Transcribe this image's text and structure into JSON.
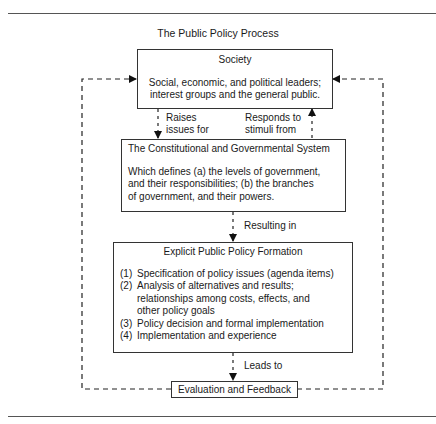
{
  "title": "The Public Policy Process",
  "society": {
    "heading": "Society",
    "body_lines": [
      "Social, economic, and political leaders;",
      "interest groups and the general public."
    ]
  },
  "arrows": {
    "raises": [
      "Raises",
      "issues for"
    ],
    "responds": [
      "Responds to",
      "stimuli from"
    ],
    "resulting": "Resulting in",
    "leads": "Leads to"
  },
  "constitutional": {
    "heading": "The Constitutional and Governmental System",
    "body_lines": [
      "Which defines (a) the levels of government,",
      "and their responsibilities; (b) the branches",
      "of government, and their powers."
    ]
  },
  "formation": {
    "heading": "Explicit Public Policy Formation",
    "items": [
      {
        "num": "(1)",
        "lines": [
          "Specification of policy issues (agenda items)"
        ]
      },
      {
        "num": "(2)",
        "lines": [
          "Analysis of alternatives and results;",
          "relationships among costs, effects, and",
          "other policy goals"
        ]
      },
      {
        "num": "(3)",
        "lines": [
          "Policy decision and formal implementation"
        ]
      },
      {
        "num": "(4)",
        "lines": [
          "Implementation and experience"
        ]
      }
    ]
  },
  "evaluation": {
    "label": "Evaluation and Feedback"
  }
}
